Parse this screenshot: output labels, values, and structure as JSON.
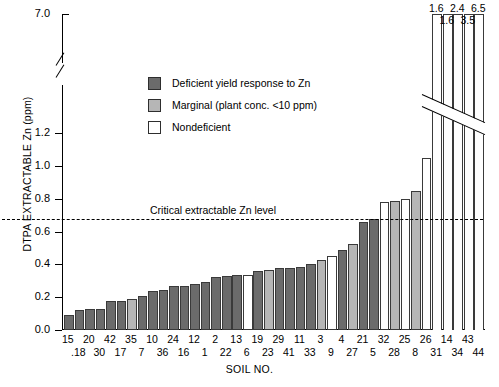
{
  "chart_data": {
    "type": "bar",
    "title": "",
    "xlabel": "SOIL NO.",
    "ylabel": "DTPA EXTRACTABLE Zn (ppm)",
    "ylim": [
      0.0,
      1.2
    ],
    "axis_break": {
      "below": 1.2,
      "above": 7.0,
      "note": "y-axis broken between 1.2 and 7.0"
    },
    "ytick_labels": [
      "0.0",
      "0.2",
      "0.4",
      "0.6",
      "0.8",
      "1.0",
      "1.2",
      "7.0"
    ],
    "ytick_values": [
      0.0,
      0.2,
      0.4,
      0.6,
      0.8,
      1.0,
      1.2,
      7.0
    ],
    "grid": false,
    "legend_position": "upper-left-inside",
    "legend": [
      {
        "key": "deficient",
        "label": "Deficient yield response to Zn",
        "color": "#6b6b6b"
      },
      {
        "key": "marginal",
        "label": "Marginal (plant conc. <10 ppm)",
        "color": "#b6b6b6"
      },
      {
        "key": "nondeficient",
        "label": "Nondeficient",
        "color": "#ffffff"
      }
    ],
    "annotations": [
      {
        "type": "hline",
        "label": "Critical extractable Zn level",
        "value": 0.675,
        "style": "dashed"
      }
    ],
    "categories": [
      "15",
      ".18",
      "20",
      "30",
      "42",
      "17",
      "35",
      "7",
      "10",
      "36",
      "24",
      "16",
      "12",
      "1",
      "2",
      "22",
      "13",
      "6",
      "19",
      "23",
      "29",
      "41",
      "11",
      "33",
      "3",
      "9",
      "4",
      "27",
      "21",
      "5",
      "32",
      "28",
      "25",
      "8",
      "26",
      "31",
      "14",
      "34",
      "43",
      "44"
    ],
    "values": [
      0.09,
      0.12,
      0.13,
      0.13,
      0.175,
      0.175,
      0.19,
      0.21,
      0.235,
      0.245,
      0.265,
      0.27,
      0.28,
      0.29,
      0.325,
      0.33,
      0.335,
      0.335,
      0.36,
      0.365,
      0.375,
      0.375,
      0.385,
      0.4,
      0.425,
      0.45,
      0.485,
      0.525,
      0.66,
      0.675,
      0.78,
      0.785,
      0.8,
      0.845,
      1.05,
      1.6,
      1.6,
      2.4,
      3.5,
      6.5
    ],
    "value_labels": [
      "",
      "",
      "",
      "",
      "",
      "",
      "",
      "",
      "",
      "",
      "",
      "",
      "",
      "",
      "",
      "",
      "",
      "",
      "",
      "",
      "",
      "",
      "",
      "",
      "",
      "",
      "",
      "",
      "",
      "",
      "",
      "",
      "",
      "",
      "",
      "1.6",
      "1.6",
      "2.4",
      "3.5",
      "6.5"
    ],
    "classes": [
      "deficient",
      "deficient",
      "deficient",
      "deficient",
      "deficient",
      "deficient",
      "marginal",
      "deficient",
      "deficient",
      "deficient",
      "deficient",
      "deficient",
      "deficient",
      "deficient",
      "deficient",
      "deficient",
      "deficient",
      "nondeficient",
      "deficient",
      "marginal",
      "deficient",
      "deficient",
      "deficient",
      "deficient",
      "marginal",
      "nondeficient",
      "deficient",
      "marginal",
      "deficient",
      "deficient",
      "nondeficient",
      "marginal",
      "nondeficient",
      "marginal",
      "nondeficient",
      "nondeficient",
      "nondeficient",
      "nondeficient",
      "nondeficient",
      "nondeficient"
    ],
    "overflow_above_break": [
      false,
      false,
      false,
      false,
      false,
      false,
      false,
      false,
      false,
      false,
      false,
      false,
      false,
      false,
      false,
      false,
      false,
      false,
      false,
      false,
      false,
      false,
      false,
      false,
      false,
      false,
      false,
      false,
      false,
      false,
      false,
      false,
      false,
      false,
      false,
      true,
      true,
      true,
      true,
      true
    ]
  }
}
